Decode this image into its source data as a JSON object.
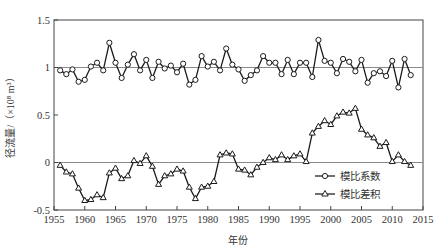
{
  "chart_data": {
    "type": "line",
    "title": "",
    "xlabel": "年份",
    "ylabel": "径流量/（×10⁸ m³）",
    "xlim": [
      1955,
      2015
    ],
    "ylim": [
      -0.5,
      1.5
    ],
    "xticks": [
      1955,
      1960,
      1965,
      1970,
      1975,
      1980,
      1985,
      1990,
      1995,
      2000,
      2005,
      2010,
      2015
    ],
    "xtick_labels": [
      "1955",
      "1960",
      "1965",
      "1970",
      "1975",
      "1980",
      "1985",
      "1990",
      "1995",
      "2000",
      "2005",
      "2010",
      "2015"
    ],
    "yticks": [
      -0.5,
      0,
      0.5,
      1,
      1.5
    ],
    "ytick_labels": [
      "-0.5",
      "0",
      "0.5",
      "1",
      "1.5"
    ],
    "reference_lines": [
      0,
      1
    ],
    "grid": false,
    "legend_position": "bottom-right",
    "x": [
      1956,
      1957,
      1958,
      1959,
      1960,
      1961,
      1962,
      1963,
      1964,
      1965,
      1966,
      1967,
      1968,
      1969,
      1970,
      1971,
      1972,
      1973,
      1974,
      1975,
      1976,
      1977,
      1978,
      1979,
      1980,
      1981,
      1982,
      1983,
      1984,
      1985,
      1986,
      1987,
      1988,
      1989,
      1990,
      1991,
      1992,
      1993,
      1994,
      1995,
      1996,
      1997,
      1998,
      1999,
      2000,
      2001,
      2002,
      2003,
      2004,
      2005,
      2006,
      2007,
      2008,
      2009,
      2010,
      2011,
      2012,
      2013
    ],
    "series": [
      {
        "name": "模比系数",
        "marker": "circle",
        "values": [
          0.97,
          0.93,
          0.98,
          0.85,
          0.87,
          1.01,
          1.05,
          0.97,
          1.26,
          1.05,
          0.89,
          1.03,
          1.14,
          0.97,
          1.08,
          0.89,
          1.06,
          0.99,
          1.02,
          0.95,
          1.04,
          0.82,
          0.87,
          1.12,
          1.01,
          1.06,
          0.97,
          1.2,
          1.03,
          0.98,
          0.86,
          0.92,
          0.97,
          1.12,
          1.05,
          1.05,
          0.93,
          1.08,
          0.93,
          1.05,
          1.05,
          0.9,
          1.29,
          1.07,
          1.05,
          0.94,
          1.09,
          1.06,
          0.96,
          1.08,
          0.84,
          0.94,
          0.96,
          0.91,
          1.07,
          0.79,
          1.09,
          0.92
        ]
      },
      {
        "name": "模比差积",
        "marker": "triangle",
        "values": [
          -0.03,
          -0.1,
          -0.12,
          -0.27,
          -0.4,
          -0.39,
          -0.34,
          -0.37,
          -0.11,
          -0.06,
          -0.17,
          -0.14,
          0.02,
          -0.01,
          0.07,
          -0.04,
          -0.23,
          -0.14,
          -0.12,
          -0.07,
          -0.09,
          -0.26,
          -0.38,
          -0.26,
          -0.25,
          -0.2,
          0.08,
          0.1,
          0.09,
          -0.07,
          -0.08,
          -0.13,
          -0.05,
          0.0,
          0.05,
          0.03,
          0.08,
          0.03,
          0.07,
          0.09,
          0.01,
          0.31,
          0.38,
          0.44,
          0.4,
          0.49,
          0.53,
          0.52,
          0.57,
          0.35,
          0.29,
          0.26,
          0.17,
          0.21,
          0.01,
          0.08,
          0.01,
          -0.03
        ]
      }
    ]
  }
}
